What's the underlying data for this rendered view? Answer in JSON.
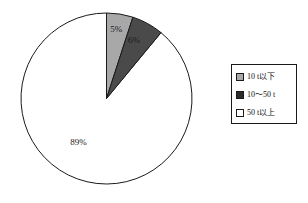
{
  "chart_data": {
    "type": "pie",
    "title": "",
    "labels": [
      "10 t以下",
      "10～50 t",
      "50 t以上"
    ],
    "values": [
      5,
      6,
      89
    ],
    "value_labels": [
      "5%",
      "6%",
      "89%"
    ],
    "colors": [
      "#a8a8a8",
      "#4a4a4a",
      "#ffffff"
    ],
    "start_angle_deg": 0,
    "direction": "clockwise",
    "legend_position": "right",
    "grid": false,
    "slices": [
      {
        "label": "10 t以下",
        "value": 5,
        "display": "5%",
        "color": "#a8a8a8"
      },
      {
        "label": "10～50 t",
        "value": 6,
        "display": "6%",
        "color": "#4a4a4a"
      },
      {
        "label": "50 t以上",
        "value": 89,
        "display": "89%",
        "color": "#ffffff"
      }
    ]
  },
  "legend": {
    "items": [
      {
        "label": "10 t以下",
        "color": "#a8a8a8"
      },
      {
        "label": "10～50 t",
        "color": "#2b2b2b"
      },
      {
        "label": "50 t以上",
        "color": "#ffffff"
      }
    ]
  },
  "style": {
    "outline": "#1a1a1a",
    "background": "#ffffff"
  }
}
